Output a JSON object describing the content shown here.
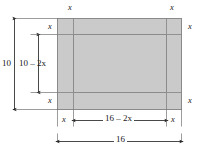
{
  "diagram": {
    "type": "geometry-box-net",
    "title": "",
    "shape": {
      "name": "rectangle-with-inset-border",
      "fill_color": "#cacaca",
      "stroke_color": "#808080",
      "outer_width_label": "16",
      "outer_height_label": "10",
      "inner_width_label": "16 – 2x",
      "inner_height_label": "10 – 2x",
      "margin_label": "x"
    },
    "labels": {
      "top_left_x": "x",
      "top_right_x": "x",
      "left_upper_x": "x",
      "left_lower_x": "x",
      "right_upper_x": "x",
      "right_lower_x": "x",
      "bottom_left_x": "x",
      "bottom_right_x": "x",
      "height_outer": "10",
      "height_inner": "10 – 2x",
      "width_inner": "16 – 2x",
      "width_outer": "16"
    },
    "dimensions": {
      "outer_width": 16,
      "outer_height": 10,
      "inner_width": "16 - 2x",
      "inner_height": "10 - 2x",
      "border_offset": "x"
    }
  }
}
